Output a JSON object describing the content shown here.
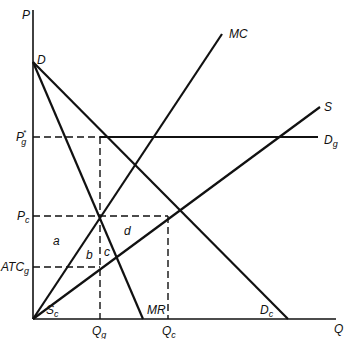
{
  "diagram": {
    "axes": {
      "y_label": "P",
      "x_label": "Q"
    },
    "curves": {
      "D_label": "D",
      "MC_label": "MC",
      "S_label": "S",
      "Dg_label": "D",
      "Dg_sub": "g",
      "Dc_label": "D",
      "Dc_sub": "c",
      "MR_label": "MR",
      "Sc_label": "S",
      "Sc_sub": "c"
    },
    "price_levels": {
      "Pg_label": "P",
      "Pg_sub": "g",
      "Pg_sup": "*",
      "Pc_label": "P",
      "Pc_sub": "c",
      "ATCg_label": "ATC",
      "ATCg_sub": "g"
    },
    "quantities": {
      "Qg_label": "Q",
      "Qg_sub": "g",
      "Qc_label": "Q",
      "Qc_sub": "c"
    },
    "areas": {
      "a": "a",
      "b": "b",
      "c": "c",
      "d": "d"
    }
  }
}
